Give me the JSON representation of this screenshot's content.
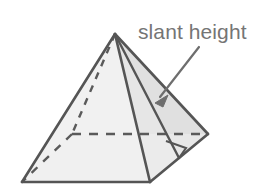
{
  "figure": {
    "name": "square-pyramid-slant-height-diagram",
    "type": "geometry-diagram",
    "shape": "square pyramid",
    "background_color": "#ffffff",
    "stroke_color": "#555555",
    "left_face_fill": "#f1f1f1",
    "right_face_fill": "#e2e2e2",
    "slant_face_fill": "#e8e8e8",
    "label_color": "#757575",
    "annotation": {
      "label": "slant height",
      "label_x": 138,
      "label_y": 19,
      "font_size": 21
    },
    "arrow": {
      "name": "slant-height-arrow",
      "from_x": 199,
      "from_y": 47,
      "to_x": 156,
      "to_y": 101
    },
    "vertices": {
      "apex": [
        115,
        34
      ],
      "base_front_left": [
        22,
        182
      ],
      "base_front_right": [
        150,
        182
      ],
      "base_back_right": [
        208,
        134
      ],
      "base_back_left": [
        72,
        134
      ],
      "slant_foot": [
        179,
        158
      ]
    },
    "edges": [
      {
        "name": "apex-to-front-left",
        "style": "solid"
      },
      {
        "name": "apex-to-front-right",
        "style": "solid"
      },
      {
        "name": "apex-to-back-right",
        "style": "solid"
      },
      {
        "name": "apex-to-back-left",
        "style": "dashed"
      },
      {
        "name": "base-front",
        "style": "solid"
      },
      {
        "name": "base-right",
        "style": "solid"
      },
      {
        "name": "base-back-right",
        "style": "dashed"
      },
      {
        "name": "base-back-left",
        "style": "dashed"
      },
      {
        "name": "slant-height",
        "style": "solid"
      }
    ],
    "right_angle_marker": {
      "name": "right-angle-marker",
      "present": true,
      "at_vertex": [
        179,
        158
      ]
    }
  }
}
